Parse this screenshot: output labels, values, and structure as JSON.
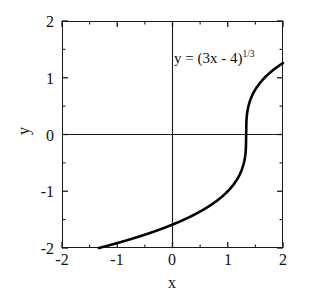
{
  "chart_data": {
    "type": "line",
    "title": "",
    "annotation": "y = (3x - 4)^(1/3)",
    "annotation_base": "y = (3x - 4)",
    "annotation_exponent": "1/3",
    "xlabel": "x",
    "ylabel": "y",
    "xlim": [
      -2,
      2
    ],
    "ylim": [
      -2,
      2
    ],
    "grid": false,
    "legend": null,
    "xticks": [
      -2,
      -1,
      0,
      1,
      2
    ],
    "yticks": [
      -2,
      -1,
      0,
      1,
      2
    ],
    "xtick_labels": [
      "-2",
      "-1",
      "0",
      "1",
      "2"
    ],
    "ytick_labels": [
      "-2",
      "-1",
      "0",
      "1",
      "2"
    ],
    "xminor_ticks": [
      -1.5,
      -0.5,
      0.5,
      1.5
    ],
    "yminor_ticks": [
      -1.5,
      -0.5,
      0.5,
      1.5
    ],
    "tick_direction": "in",
    "axis_lines": {
      "x_zero": 0,
      "y_zero": 0
    },
    "series": [
      {
        "name": "y = (3x - 4)^(1/3)",
        "color": "#000000",
        "linewidth": 2.6,
        "x": [
          -2,
          -1.9,
          -1.8,
          -1.7,
          -1.6,
          -1.5,
          -1.4,
          -1.3,
          -1.2,
          -1.1,
          -1,
          -0.9,
          -0.8,
          -0.7,
          -0.6,
          -0.5,
          -0.4,
          -0.3,
          -0.2,
          -0.1,
          0,
          0.1,
          0.2,
          0.3,
          0.4,
          0.5,
          0.6,
          0.7,
          0.8,
          0.9,
          1,
          1.05,
          1.1,
          1.15,
          1.2,
          1.25,
          1.28,
          1.3,
          1.32,
          1.333,
          1.35,
          1.37,
          1.4,
          1.45,
          1.5,
          1.55,
          1.6,
          1.65,
          1.7,
          1.75,
          1.8,
          1.85,
          1.9,
          1.95,
          2
        ],
        "y": [
          -2.154,
          -2.132,
          -2.11,
          -2.088,
          -2.065,
          -2.041,
          -2.018,
          -1.993,
          -1.969,
          -1.944,
          -1.913,
          -1.893,
          -1.866,
          -1.839,
          -1.811,
          -1.783,
          -1.754,
          -1.724,
          -1.694,
          -1.663,
          -1.587,
          -1.599,
          -1.565,
          -1.53,
          -1.494,
          -1.458,
          -1.42,
          -1.381,
          -1.34,
          -1.297,
          -1.26,
          -1.213,
          -1.182,
          -1.149,
          -1.113,
          -1.075,
          -1.05,
          -1.032,
          -1.013,
          -1.0,
          -0.962,
          -0.919,
          -0.843,
          -0.7,
          -0.522,
          -0.42,
          -0.342,
          -0.253,
          -0.105,
          0.112,
          0.35,
          0.55,
          0.72,
          0.97,
          1.26
        ]
      }
    ]
  },
  "ticks": {
    "x": [
      {
        "label": "-2",
        "value": -2
      },
      {
        "label": "-1",
        "value": -1
      },
      {
        "label": "0",
        "value": 0
      },
      {
        "label": "1",
        "value": 1
      },
      {
        "label": "2",
        "value": 2
      }
    ],
    "y": [
      {
        "label": "2",
        "value": 2
      },
      {
        "label": "1",
        "value": 1
      },
      {
        "label": "0",
        "value": 0
      },
      {
        "label": "-1",
        "value": -1
      },
      {
        "label": "-2",
        "value": -2
      }
    ]
  }
}
